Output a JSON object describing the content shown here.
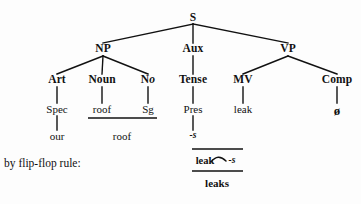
{
  "diagram": {
    "type": "syntax-tree",
    "background_color": "#fdfdfd",
    "ink_color": "#111111",
    "nodes": {
      "s": "S",
      "np": "NP",
      "aux": "Aux",
      "vp": "VP",
      "art": "Art",
      "noun": "Noun",
      "number_n": "N",
      "number_o": "o",
      "tense": "Tense",
      "mv": "MV",
      "comp": "Comp"
    },
    "terminals": {
      "spec": "Spec",
      "roof_upper": "roof",
      "sg": "Sg",
      "pres": "Pres",
      "leak": "leak",
      "null": "ø",
      "our": "our",
      "roof_lower": "roof",
      "suffix_s": "-s"
    },
    "rule": {
      "label": "by flip-flop rule:",
      "input_stem": "leak",
      "input_suffix": "-s",
      "output": "leaks"
    }
  }
}
